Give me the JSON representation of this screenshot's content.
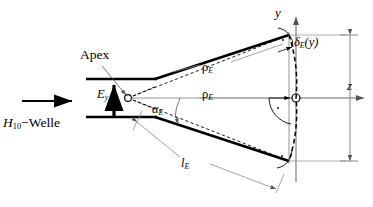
{
  "figure": {
    "colors": {
      "outline": "#000000",
      "thin_line": "#808080",
      "dashed": "#000000",
      "background": "#ffffff"
    }
  },
  "labels": {
    "apex": "Apex",
    "incident_wave": "H",
    "incident_wave_sub": "10",
    "incident_wave_rest": "−Welle",
    "field_ey": "E",
    "field_ey_sub": "y",
    "flare_angle": "α",
    "flare_angle_sub": "E",
    "rho_upper": "ρ",
    "rho_upper_sub": "E",
    "rho_mid": "ρ",
    "rho_mid_sub": "E",
    "delta": "δ",
    "delta_sub": "E",
    "delta_arg": "(y)",
    "length": "l",
    "length_sub": "E",
    "axis_y": "y",
    "axis_z": "z"
  },
  "geometry": {
    "apex_point": {
      "x": 126,
      "y": 98
    },
    "origin_point": {
      "x": 296,
      "y": 98
    },
    "waveguide": {
      "x_start": 86,
      "x_end": 156,
      "top_y": 79,
      "bottom_y": 117
    },
    "flare": {
      "upper_start": {
        "x": 156,
        "y": 79
      },
      "upper_end": {
        "x": 288,
        "y": 35
      },
      "lower_start": {
        "x": 156,
        "y": 117
      },
      "lower_end": {
        "x": 288,
        "y": 161
      }
    },
    "aperture_dimension_x": 350,
    "axis_y_top": 14,
    "axis_z_right": 367
  },
  "icons": {
    "propagation_arrow": "arrow-right-icon",
    "field_arrow": "arrow-up-icon",
    "axis_arrow": "axis-arrow-icon",
    "apex_marker": "circle-marker-icon",
    "origin_marker": "circle-marker-icon",
    "right_angle_mark": "right-angle-icon"
  }
}
